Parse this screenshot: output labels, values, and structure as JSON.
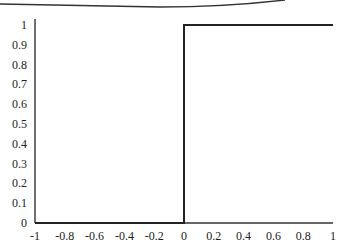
{
  "chart_data": {
    "type": "line",
    "title": "",
    "xlabel": "",
    "ylabel": "",
    "xlim": [
      -1,
      1
    ],
    "ylim": [
      0,
      1
    ],
    "grid": false,
    "legend": null,
    "x_ticks": [
      "-1",
      "-0.8",
      "-0.6",
      "-0.4",
      "-0.2",
      "0",
      "0.2",
      "0.4",
      "0.6",
      "0.8",
      "1"
    ],
    "y_ticks": [
      "0",
      "0.1",
      "0.2",
      "0.3",
      "0.4",
      "0.5",
      "0.6",
      "0.7",
      "0.8",
      "0.9",
      "1"
    ],
    "series": [
      {
        "name": "step function",
        "x": [
          -1,
          0,
          0,
          1
        ],
        "y": [
          0,
          0,
          1,
          1
        ],
        "color": "#222222"
      }
    ],
    "annotations": []
  },
  "style": {
    "line_color": "#222222",
    "axis_color": "#333333",
    "background": "#ffffff"
  }
}
